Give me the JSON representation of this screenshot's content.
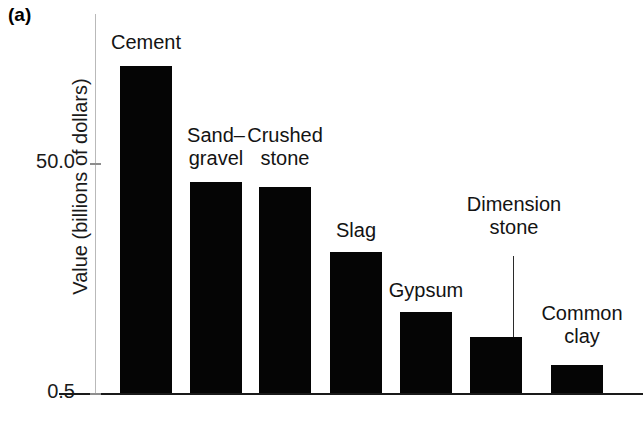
{
  "panel": {
    "letter": "(a)"
  },
  "axes": {
    "y_title": "Value (billions of dollars)",
    "y_ticks": [
      {
        "label": "50.0",
        "value": 50.0,
        "y": 163
      },
      {
        "label": "0.5",
        "value": 0.5,
        "y": 393
      }
    ],
    "x_ticks": []
  },
  "bars": [
    {
      "label": "Cement",
      "value": 70.8,
      "x": 120,
      "width": 52,
      "top": 66,
      "label_x": 104,
      "label_y": 31,
      "label_align": "center",
      "label_width": 84
    },
    {
      "label": "Sand–\ngravel",
      "value": 45.9,
      "x": 190,
      "width": 52,
      "top": 182,
      "label_x": 166,
      "label_y": 124,
      "label_align": "center",
      "label_width": 100
    },
    {
      "label": "Crushed\nstone",
      "value": 44.9,
      "x": 259,
      "width": 52,
      "top": 187,
      "label_x": 239,
      "label_y": 124,
      "label_align": "center",
      "label_width": 92
    },
    {
      "label": "Slag",
      "value": 30.9,
      "x": 330,
      "width": 52,
      "top": 252,
      "label_x": 318,
      "label_y": 219,
      "label_align": "center",
      "label_width": 76
    },
    {
      "label": "Gypsum",
      "value": 18.1,
      "x": 400,
      "width": 52,
      "top": 312,
      "label_x": 378,
      "label_y": 279,
      "label_align": "center",
      "label_width": 96
    },
    {
      "label": "Dimension\nstone",
      "value": 12.7,
      "x": 470,
      "width": 52,
      "top": 337,
      "label_x": 452,
      "label_y": 193,
      "label_align": "center",
      "label_width": 124
    },
    {
      "label": "Common\nclay",
      "value": 6.7,
      "x": 551,
      "width": 52,
      "top": 365,
      "label_x": 530,
      "label_y": 302,
      "label_align": "center",
      "label_width": 104
    }
  ],
  "leader_line": {
    "x": 513,
    "top": 256,
    "height": 81
  },
  "chart_data": {
    "type": "bar",
    "title": "(a)",
    "xlabel": "",
    "ylabel": "Value (billions of dollars)",
    "categories": [
      "Cement",
      "Sand–gravel",
      "Crushed stone",
      "Slag",
      "Gypsum",
      "Dimension stone",
      "Common clay"
    ],
    "values": [
      70.8,
      45.9,
      44.9,
      30.9,
      18.1,
      12.7,
      6.7
    ],
    "ytick_labels": [
      "50.0",
      "0.5"
    ],
    "ytick_values": [
      50.0,
      0.5
    ],
    "ylim": [
      0.5,
      82.5
    ],
    "grid": false,
    "legend": "none",
    "bar_color": "#050505",
    "annotations": [
      {
        "text": "Dimension stone",
        "kind": "leader-line-label",
        "points_to": "Dimension stone"
      }
    ]
  }
}
